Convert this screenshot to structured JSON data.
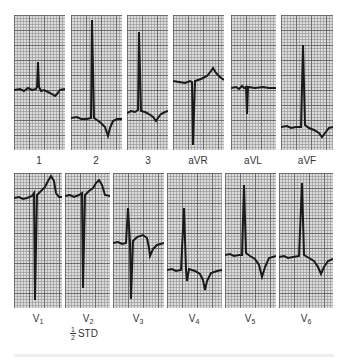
{
  "figure": {
    "type": "12-lead ECG",
    "top_row": [
      {
        "lead": "1",
        "label": "1"
      },
      {
        "lead": "2",
        "label": "2"
      },
      {
        "lead": "3",
        "label": "3"
      },
      {
        "lead": "aVR",
        "label": "aVR"
      },
      {
        "lead": "aVL",
        "label": "aVL"
      },
      {
        "lead": "aVF",
        "label": "aVF"
      }
    ],
    "bottom_row": [
      {
        "lead": "V1",
        "label": "V",
        "sub": "1"
      },
      {
        "lead": "V2",
        "label": "V",
        "sub": "2"
      },
      {
        "lead": "V3",
        "label": "V",
        "sub": "3"
      },
      {
        "lead": "V4",
        "label": "V",
        "sub": "4"
      },
      {
        "lead": "V5",
        "label": "V",
        "sub": "5"
      },
      {
        "lead": "V6",
        "label": "V",
        "sub": "6"
      }
    ],
    "calibration": {
      "num": "1",
      "den": "2",
      "text": "STD"
    },
    "colors": {
      "grid_bg": "#dcdcdc",
      "trace": "#1a1a1a",
      "label": "#333333"
    }
  }
}
